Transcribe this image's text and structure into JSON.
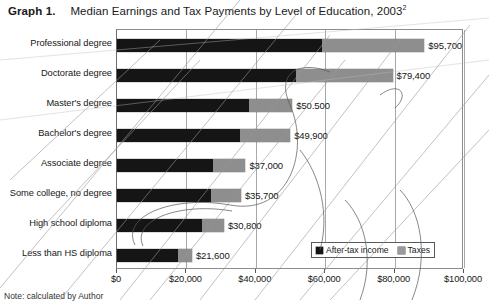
{
  "title": {
    "graph_label": "Graph 1.",
    "text": "Median Earnings and Tax Payments by Level of Education, 2003",
    "superscript": "2"
  },
  "legend": {
    "items": [
      {
        "label": "After-tax income",
        "swatch": "black-square-icon",
        "color": "#151515"
      },
      {
        "label": "Taxes",
        "swatch": "gray-square-icon",
        "color": "#9a9a9a"
      }
    ]
  },
  "footnote": "Note: calculated by Author",
  "chart_data": {
    "type": "bar",
    "orientation": "horizontal",
    "stacked": true,
    "title": "Median Earnings and Tax Payments by Level of Education, 2003",
    "xlabel": "",
    "ylabel": "",
    "xlim": [
      0,
      100000
    ],
    "xticks": [
      0,
      20000,
      40000,
      60000,
      80000,
      100000
    ],
    "xtick_labels": [
      "$0",
      "$20,000",
      "$40,000",
      "$60,000",
      "$80,000",
      "$100,000"
    ],
    "grid": true,
    "legend_position": "bottom-right",
    "categories": [
      "Professional degree",
      "Doctorate degree",
      "Master's degree",
      "Bachelor's degree",
      "Associate degree",
      "Some college, no degree",
      "High school diploma",
      "Less than HS diploma"
    ],
    "series": [
      {
        "name": "After-tax income",
        "color": "#151515",
        "values": [
          59000,
          51600,
          37900,
          35400,
          27800,
          27100,
          24600,
          17700
        ]
      },
      {
        "name": "Taxes",
        "color": "#8e8e8e",
        "values": [
          36700,
          27800,
          12600,
          14500,
          9200,
          8600,
          6200,
          3900
        ]
      }
    ],
    "totals": [
      95700,
      79400,
      50500,
      49900,
      37000,
      35700,
      30800,
      21600
    ],
    "data_labels": [
      "$95,700",
      "$79,400",
      "$50.500",
      "$49,900",
      "$37,000",
      "$35,700",
      "$30,800",
      "$21,600"
    ]
  }
}
